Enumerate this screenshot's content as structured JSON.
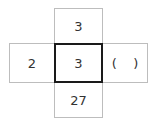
{
  "diagram": {
    "cells": {
      "top": "3",
      "left": "2",
      "center": "3",
      "right": "(    )",
      "bottom": "27"
    }
  }
}
